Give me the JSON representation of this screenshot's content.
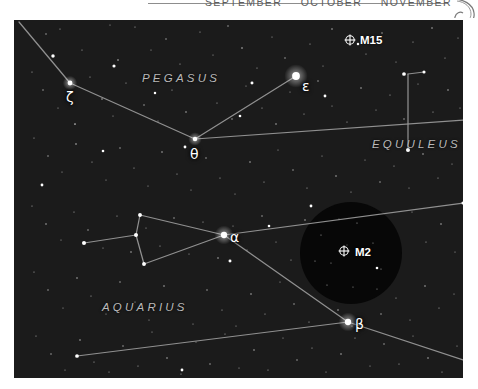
{
  "header": {
    "months": [
      "SEPTEMBER",
      "OCTOBER",
      "NOVEMBER"
    ],
    "rule_color": "#8d8d8d",
    "text_color": "#5d5d5d"
  },
  "chart_data": {
    "type": "scatter",
    "xlabel": "",
    "ylabel": "",
    "background_color": "#1b1b1b",
    "star_color": "#ffffff",
    "line_color": "#9a9a9a",
    "label_color": "#b9b9b9",
    "grid": false,
    "legend_position": "none",
    "xlim": [
      0,
      449
    ],
    "ylim": [
      0,
      358
    ],
    "constellations": [
      {
        "name": "PEGASUS",
        "x": 128,
        "y": 52
      },
      {
        "name": "EQUULEUS",
        "x": 358,
        "y": 118
      },
      {
        "name": "AQUARIUS",
        "x": 88,
        "y": 281
      }
    ],
    "named_stars": [
      {
        "label": "ζ",
        "name": "zeta-pegasi",
        "x": 56,
        "y": 63,
        "mag": 3.4,
        "label_dx": -4,
        "label_dy": 6
      },
      {
        "label": "θ",
        "name": "theta-pegasi",
        "x": 181,
        "y": 119,
        "mag": 3.5,
        "label_dx": -5,
        "label_dy": 7
      },
      {
        "label": "ε",
        "name": "epsilon-pegasi",
        "x": 282,
        "y": 56,
        "mag": 2.4,
        "label_dx": 6,
        "label_dy": 2
      },
      {
        "label": "α",
        "name": "alpha-aquarii",
        "x": 210,
        "y": 215,
        "mag": 2.9,
        "label_dx": 6,
        "label_dy": -6
      },
      {
        "label": "β",
        "name": "beta-aquarii",
        "x": 334,
        "y": 302,
        "mag": 2.9,
        "label_dx": 7,
        "label_dy": -6
      }
    ],
    "deep_sky_objects": [
      {
        "label": "M15",
        "name": "m15-globular-cluster",
        "x": 336,
        "y": 20,
        "symbol": "globular-cluster",
        "label_dx": 10,
        "label_dy": -6
      },
      {
        "label": "M2",
        "name": "m2-globular-cluster",
        "x": 330,
        "y": 231,
        "symbol": "globular-cluster",
        "label_dx": 11,
        "label_dy": -5
      }
    ],
    "finder_circle": {
      "name": "finder-field-circle",
      "cx": 337,
      "cy": 233,
      "r": 51,
      "fill": "#070707"
    },
    "constellation_lines": [
      {
        "name": "pegasus-zeta-theta-epsilon",
        "points": [
          [
            5,
            2
          ],
          [
            56,
            63
          ],
          [
            181,
            119
          ],
          [
            282,
            56
          ]
        ]
      },
      {
        "name": "pegasus-theta-east",
        "points": [
          [
            181,
            119
          ],
          [
            449,
            100
          ]
        ]
      },
      {
        "name": "equuleus-stem",
        "points": [
          [
            394,
            54
          ],
          [
            394,
            130
          ]
        ]
      },
      {
        "name": "equuleus-top-bar",
        "points": [
          [
            394,
            54
          ],
          [
            410,
            52
          ]
        ]
      },
      {
        "name": "aquarius-jar",
        "points": [
          [
            70,
            223
          ],
          [
            122,
            215
          ],
          [
            126,
            195
          ],
          [
            210,
            215
          ],
          [
            130,
            244
          ],
          [
            122,
            215
          ]
        ]
      },
      {
        "name": "aquarius-alpha-beta",
        "points": [
          [
            210,
            215
          ],
          [
            334,
            302
          ]
        ]
      },
      {
        "name": "aquarius-alpha-east",
        "points": [
          [
            210,
            215
          ],
          [
            449,
            183
          ]
        ]
      },
      {
        "name": "aquarius-beta-west",
        "points": [
          [
            334,
            302
          ],
          [
            63,
            336
          ]
        ]
      },
      {
        "name": "aquarius-beta-southeast",
        "points": [
          [
            334,
            302
          ],
          [
            449,
            340
          ]
        ]
      }
    ],
    "background_stars": [
      [
        32,
        14,
        1.1
      ],
      [
        46,
        9,
        1.0
      ],
      [
        68,
        30,
        1.0
      ],
      [
        96,
        5,
        0.9
      ],
      [
        104,
        40,
        1.3
      ],
      [
        121,
        7,
        1.0
      ],
      [
        137,
        30,
        0.9
      ],
      [
        152,
        19,
        1.1
      ],
      [
        166,
        44,
        1.0
      ],
      [
        186,
        12,
        1.0
      ],
      [
        199,
        35,
        0.9
      ],
      [
        214,
        6,
        1.1
      ],
      [
        228,
        28,
        1.3
      ],
      [
        243,
        48,
        1.0
      ],
      [
        258,
        17,
        0.9
      ],
      [
        271,
        38,
        1.1
      ],
      [
        296,
        24,
        1.0
      ],
      [
        309,
        46,
        0.9
      ],
      [
        318,
        9,
        1.2
      ],
      [
        352,
        34,
        1.0
      ],
      [
        368,
        13,
        1.1
      ],
      [
        382,
        42,
        0.9
      ],
      [
        399,
        22,
        1.0
      ],
      [
        418,
        8,
        1.2
      ],
      [
        431,
        38,
        1.0
      ],
      [
        444,
        18,
        0.9
      ],
      [
        18,
        52,
        1.0
      ],
      [
        29,
        70,
        1.1
      ],
      [
        44,
        88,
        0.9
      ],
      [
        61,
        104,
        1.4
      ],
      [
        76,
        57,
        1.0
      ],
      [
        88,
        79,
        1.2
      ],
      [
        99,
        96,
        0.9
      ],
      [
        112,
        63,
        1.0
      ],
      [
        130,
        85,
        1.1
      ],
      [
        144,
        101,
        0.9
      ],
      [
        158,
        70,
        1.0
      ],
      [
        172,
        92,
        1.2
      ],
      [
        190,
        60,
        0.9
      ],
      [
        203,
        83,
        1.0
      ],
      [
        218,
        99,
        1.1
      ],
      [
        232,
        66,
        0.9
      ],
      [
        248,
        88,
        1.0
      ],
      [
        262,
        104,
        1.2
      ],
      [
        276,
        72,
        0.9
      ],
      [
        290,
        94,
        1.0
      ],
      [
        304,
        61,
        1.1
      ],
      [
        318,
        86,
        0.9
      ],
      [
        333,
        102,
        1.0
      ],
      [
        347,
        68,
        1.2
      ],
      [
        362,
        90,
        0.9
      ],
      [
        376,
        75,
        1.0
      ],
      [
        390,
        99,
        1.1
      ],
      [
        404,
        64,
        0.9
      ],
      [
        419,
        92,
        1.0
      ],
      [
        434,
        70,
        1.2
      ],
      [
        446,
        88,
        0.9
      ],
      [
        20,
        118,
        1.0
      ],
      [
        34,
        136,
        1.1
      ],
      [
        48,
        152,
        0.9
      ],
      [
        62,
        124,
        1.3
      ],
      [
        78,
        142,
        1.0
      ],
      [
        92,
        160,
        0.9
      ],
      [
        106,
        128,
        1.1
      ],
      [
        120,
        148,
        1.0
      ],
      [
        134,
        166,
        0.9
      ],
      [
        148,
        132,
        1.2
      ],
      [
        163,
        154,
        1.0
      ],
      [
        177,
        170,
        0.9
      ],
      [
        192,
        138,
        1.1
      ],
      [
        206,
        158,
        1.0
      ],
      [
        221,
        174,
        0.9
      ],
      [
        236,
        142,
        1.2
      ],
      [
        250,
        162,
        1.0
      ],
      [
        264,
        130,
        0.9
      ],
      [
        279,
        150,
        1.1
      ],
      [
        293,
        168,
        1.0
      ],
      [
        308,
        136,
        0.9
      ],
      [
        322,
        156,
        1.2
      ],
      [
        337,
        172,
        1.0
      ],
      [
        351,
        140,
        0.9
      ],
      [
        366,
        162,
        1.1
      ],
      [
        380,
        146,
        1.0
      ],
      [
        395,
        168,
        0.9
      ],
      [
        409,
        134,
        1.2
      ],
      [
        424,
        158,
        1.0
      ],
      [
        438,
        144,
        0.9
      ],
      [
        18,
        186,
        1.0
      ],
      [
        32,
        204,
        1.2
      ],
      [
        47,
        220,
        0.9
      ],
      [
        60,
        192,
        1.0
      ],
      [
        74,
        210,
        1.1
      ],
      [
        89,
        228,
        0.9
      ],
      [
        103,
        196,
        1.0
      ],
      [
        117,
        232,
        1.2
      ],
      [
        132,
        208,
        0.9
      ],
      [
        146,
        226,
        1.0
      ],
      [
        160,
        198,
        1.1
      ],
      [
        175,
        234,
        0.9
      ],
      [
        189,
        202,
        1.0
      ],
      [
        204,
        238,
        1.2
      ],
      [
        219,
        206,
        0.9
      ],
      [
        233,
        230,
        1.0
      ],
      [
        248,
        196,
        1.1
      ],
      [
        262,
        222,
        0.9
      ],
      [
        277,
        240,
        1.0
      ],
      [
        291,
        200,
        1.2
      ],
      [
        306,
        218,
        0.9
      ],
      [
        369,
        200,
        1.0
      ],
      [
        384,
        228,
        1.1
      ],
      [
        398,
        192,
        0.9
      ],
      [
        412,
        222,
        1.0
      ],
      [
        427,
        204,
        1.2
      ],
      [
        441,
        232,
        0.9
      ],
      [
        20,
        252,
        1.0
      ],
      [
        34,
        270,
        1.1
      ],
      [
        49,
        288,
        0.9
      ],
      [
        63,
        258,
        1.2
      ],
      [
        77,
        276,
        1.0
      ],
      [
        92,
        294,
        0.9
      ],
      [
        106,
        262,
        1.1
      ],
      [
        121,
        282,
        1.0
      ],
      [
        135,
        300,
        0.9
      ],
      [
        150,
        266,
        1.2
      ],
      [
        164,
        286,
        1.0
      ],
      [
        179,
        304,
        0.9
      ],
      [
        193,
        270,
        1.1
      ],
      [
        208,
        290,
        1.0
      ],
      [
        222,
        306,
        0.9
      ],
      [
        237,
        274,
        1.2
      ],
      [
        251,
        294,
        1.0
      ],
      [
        266,
        262,
        0.9
      ],
      [
        280,
        284,
        1.1
      ],
      [
        295,
        302,
        1.0
      ],
      [
        309,
        268,
        0.9
      ],
      [
        324,
        290,
        1.2
      ],
      [
        338,
        306,
        1.0
      ],
      [
        353,
        272,
        0.9
      ],
      [
        367,
        294,
        1.1
      ],
      [
        382,
        278,
        1.0
      ],
      [
        396,
        300,
        0.9
      ],
      [
        411,
        266,
        1.2
      ],
      [
        425,
        288,
        1.0
      ],
      [
        440,
        274,
        0.9
      ],
      [
        22,
        316,
        1.0
      ],
      [
        37,
        334,
        1.1
      ],
      [
        51,
        350,
        0.9
      ],
      [
        66,
        320,
        1.2
      ],
      [
        80,
        342,
        1.0
      ],
      [
        95,
        352,
        0.9
      ],
      [
        109,
        326,
        1.1
      ],
      [
        124,
        346,
        1.0
      ],
      [
        138,
        312,
        0.9
      ],
      [
        153,
        338,
        1.2
      ],
      [
        167,
        354,
        1.0
      ],
      [
        182,
        322,
        0.9
      ],
      [
        196,
        344,
        1.1
      ],
      [
        211,
        314,
        1.0
      ],
      [
        225,
        348,
        0.9
      ],
      [
        240,
        330,
        1.2
      ],
      [
        254,
        350,
        1.0
      ],
      [
        269,
        318,
        0.9
      ],
      [
        283,
        340,
        1.1
      ],
      [
        298,
        328,
        1.0
      ],
      [
        312,
        352,
        0.9
      ],
      [
        327,
        334,
        1.2
      ],
      [
        341,
        318,
        1.0
      ],
      [
        356,
        346,
        0.9
      ],
      [
        370,
        324,
        1.1
      ],
      [
        385,
        344,
        1.0
      ],
      [
        399,
        316,
        0.9
      ],
      [
        414,
        338,
        1.2
      ],
      [
        428,
        352,
        1.0
      ],
      [
        443,
        326,
        0.9
      ]
    ],
    "bright_field_stars": [
      [
        39,
        36,
        2.2
      ],
      [
        100,
        46,
        2.0
      ],
      [
        238,
        63,
        1.9
      ],
      [
        311,
        76,
        1.8
      ],
      [
        390,
        54,
        2.4
      ],
      [
        410,
        52,
        2.0
      ],
      [
        394,
        130,
        2.6
      ],
      [
        70,
        223,
        2.6
      ],
      [
        122,
        215,
        2.6
      ],
      [
        126,
        195,
        2.5
      ],
      [
        130,
        244,
        2.5
      ],
      [
        216,
        241,
        1.9
      ],
      [
        63,
        336,
        2.4
      ],
      [
        28,
        165,
        1.8
      ],
      [
        171,
        127,
        1.8
      ],
      [
        255,
        206,
        1.7
      ],
      [
        297,
        186,
        1.8
      ],
      [
        363,
        248,
        1.7
      ],
      [
        449,
        183,
        2.0
      ],
      [
        168,
        350,
        1.8
      ],
      [
        344,
        24,
        1.6
      ],
      [
        226,
        96,
        1.7
      ],
      [
        141,
        73,
        1.6
      ],
      [
        89,
        131,
        1.7
      ]
    ]
  }
}
